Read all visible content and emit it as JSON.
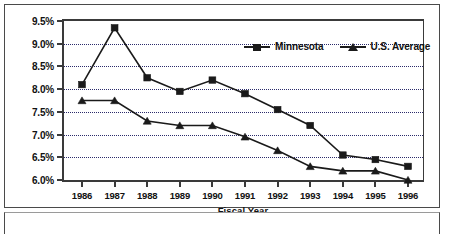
{
  "chart_data": {
    "type": "line",
    "title": "",
    "xlabel": "Fiscal Year",
    "ylabel": "",
    "x": [
      1986,
      1987,
      1988,
      1989,
      1990,
      1991,
      1992,
      1993,
      1994,
      1995,
      1996
    ],
    "categories": [
      "1986",
      "1987",
      "1988",
      "1989",
      "1990",
      "1991",
      "1992",
      "1993",
      "1994",
      "1995",
      "1996"
    ],
    "series": [
      {
        "name": "Minnesota",
        "marker": "square",
        "color": "#1a1a1a",
        "values": [
          8.1,
          9.35,
          8.25,
          7.95,
          8.2,
          7.9,
          7.55,
          7.2,
          6.55,
          6.45,
          6.3
        ]
      },
      {
        "name": "U.S. Average",
        "marker": "triangle",
        "color": "#1a1a1a",
        "values": [
          7.75,
          7.75,
          7.3,
          7.2,
          7.2,
          6.95,
          6.65,
          6.3,
          6.2,
          6.2,
          6.0
        ]
      }
    ],
    "ylim": [
      6.0,
      9.5
    ],
    "yticks": [
      6.0,
      6.5,
      7.0,
      7.5,
      8.0,
      8.5,
      9.0,
      9.5
    ],
    "ytick_labels": [
      "6.0%",
      "6.5%",
      "7.0%",
      "7.5%",
      "8.0%",
      "8.5%",
      "9.0%",
      "9.5%"
    ],
    "grid": true,
    "grid_style": "dotted",
    "grid_color": "#2b2b6b",
    "legend_position": "top-right-inside"
  },
  "legend": {
    "entries": [
      {
        "label": "Minnesota",
        "icon": "square-marker-icon"
      },
      {
        "label": "U.S. Average",
        "icon": "triangle-marker-icon"
      }
    ]
  },
  "axes": {
    "x_title": "Fiscal Year"
  }
}
